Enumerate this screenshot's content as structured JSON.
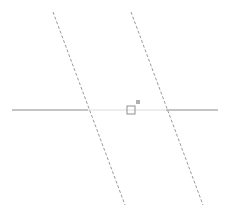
{
  "figure": {
    "width": 227,
    "height": 210,
    "background_color": "#ffffff"
  },
  "colors": {
    "horizontal_line_dark": "#8a8a8a",
    "horizontal_line_faint": "#dcdcdc",
    "dashed_line": "#9a9a9a",
    "marker_outline": "#8f8f8f",
    "marker_fill": "#b0b0b0"
  },
  "horizontal_line": {
    "name": "horizontal-line",
    "y": 110,
    "x_start": 12,
    "x_end": 218,
    "stroke_width": 1,
    "segments": [
      {
        "name": "left-segment",
        "x1": 12,
        "y1": 110,
        "x2": 88,
        "y2": 110,
        "shade": "dark"
      },
      {
        "name": "middle-segment",
        "x1": 88,
        "y1": 110,
        "x2": 166,
        "y2": 110,
        "shade": "faint"
      },
      {
        "name": "right-segment",
        "x1": 166,
        "y1": 110,
        "x2": 218,
        "y2": 110,
        "shade": "dark"
      }
    ]
  },
  "dashed_lines": [
    {
      "name": "left-dashed-line",
      "x1": 53,
      "y1": 12,
      "x2": 125,
      "y2": 205,
      "dash": "3 2",
      "stroke_width": 1,
      "intersection_x": 88
    },
    {
      "name": "right-dashed-line",
      "x1": 131,
      "y1": 12,
      "x2": 203,
      "y2": 205,
      "dash": "3 2",
      "stroke_width": 1,
      "intersection_x": 166
    }
  ],
  "marker": {
    "name": "square-marker",
    "outline_square": {
      "x": 127,
      "y": 106,
      "size": 8
    },
    "filled_square": {
      "x": 136,
      "y": 100,
      "size": 4
    }
  },
  "chart_data": {
    "type": "scatter",
    "xlabel": "",
    "ylabel": "",
    "xlim": [
      0,
      227
    ],
    "ylim": [
      0,
      210
    ],
    "grid": false,
    "legend": null,
    "tick_labels": {
      "x": [],
      "y": []
    },
    "annotations": [],
    "series": [
      {
        "name": "horizontal-line",
        "style": "solid",
        "points": [
          [
            12,
            110
          ],
          [
            218,
            110
          ]
        ]
      },
      {
        "name": "left-dashed-line",
        "style": "dashed",
        "points": [
          [
            53,
            12
          ],
          [
            125,
            205
          ]
        ]
      },
      {
        "name": "right-dashed-line",
        "style": "dashed",
        "points": [
          [
            131,
            12
          ],
          [
            203,
            205
          ]
        ]
      },
      {
        "name": "square-marker",
        "style": "marker",
        "points": [
          [
            131,
            110
          ]
        ]
      }
    ]
  }
}
